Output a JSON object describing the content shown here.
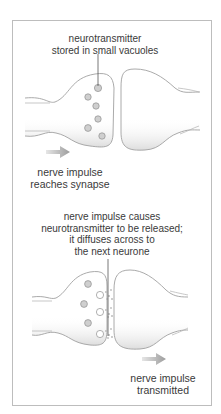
{
  "figure": {
    "top_panel": {
      "label_lines": [
        "neurotransmitter",
        "stored in small vacuoles"
      ],
      "caption_lines": [
        "nerve impulse",
        "reaches synapse"
      ],
      "arrow": "right-arrow",
      "vesicle_count": 6
    },
    "bottom_panel": {
      "label_lines": [
        "nerve impulse causes",
        "neurotransmitter to be released;",
        "it diffuses across to",
        "the next neurone"
      ],
      "caption_lines": [
        "nerve impulse",
        "transmitted"
      ],
      "arrow": "right-arrow",
      "vesicle_count_free": 3,
      "vesicle_count_released": 3
    },
    "colors": {
      "outline": "#9a9a9a",
      "vesicle": "#b8b8b8",
      "arrow": "#a8a8a8",
      "shading": "#e6e6e6",
      "frame": "#bdbdbd"
    }
  }
}
